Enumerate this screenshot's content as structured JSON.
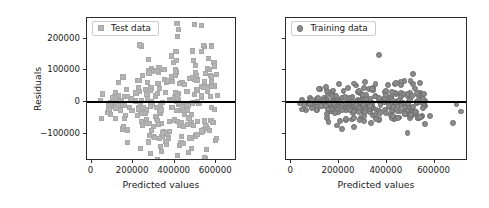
{
  "chart_data": [
    {
      "type": "scatter",
      "title": "",
      "xlabel": "Predicted values",
      "ylabel": "Residuals",
      "legend": "Test data",
      "legend_position": "upper-left",
      "marker": "square",
      "marker_color": "#b4b4b4",
      "grid": false,
      "xlim": [
        -22000,
        700000
      ],
      "ylim": [
        -185000,
        265000
      ],
      "xticks": [
        0,
        200000,
        400000,
        600000
      ],
      "xticklabels": [
        "0",
        "200000",
        "400000",
        "600000"
      ],
      "yticks": [
        -100000,
        0,
        100000,
        200000
      ],
      "yticklabels": [
        "−100000",
        "0",
        "100000",
        "200000"
      ],
      "reference_line": {
        "y": 0,
        "color": "#000000",
        "width": 2.2
      },
      "n_points": 230,
      "seed": 1337,
      "spread_model": {
        "base": 26000,
        "slope": 0.175,
        "x_min": 35000,
        "x_max": 600000
      },
      "points": [
        [
          406000,
          252000
        ],
        [
          571000,
          178000
        ],
        [
          404000,
          134000
        ],
        [
          588000,
          117000
        ],
        [
          312000,
          104000
        ],
        [
          288000,
          100000
        ],
        [
          402000,
          98000
        ],
        [
          481000,
          82000
        ],
        [
          272000,
          95000
        ],
        [
          398000,
          88000
        ],
        [
          345000,
          74000
        ],
        [
          535000,
          49000
        ],
        [
          420000,
          62000
        ],
        [
          360000,
          70000
        ],
        [
          524000,
          25000
        ],
        [
          455000,
          38000
        ],
        [
          566000,
          20000
        ],
        [
          408000,
          16000
        ],
        [
          538000,
          -56000
        ],
        [
          561000,
          -86000
        ],
        [
          487000,
          -70000
        ],
        [
          430000,
          -60000
        ],
        [
          372000,
          -88000
        ],
        [
          346000,
          -92000
        ],
        [
          268000,
          -122000
        ],
        [
          300000,
          -108000
        ],
        [
          322000,
          -112000
        ],
        [
          409000,
          -165000
        ],
        [
          338000,
          -94000
        ],
        [
          284000,
          -86000
        ]
      ],
      "xlabel_note": "Predicted values",
      "axis_color": "#2b2b2b"
    },
    {
      "type": "scatter",
      "title": "",
      "xlabel": "Predicted values",
      "ylabel": "",
      "legend": "Training data",
      "legend_position": "upper-left",
      "marker": "circle",
      "marker_color": "#8c8c8c",
      "grid": false,
      "xlim": [
        -22000,
        740000
      ],
      "ylim": [
        -185000,
        265000
      ],
      "xticks": [
        0,
        200000,
        400000,
        600000
      ],
      "xticklabels": [
        "0",
        "200000",
        "400000",
        "600000"
      ],
      "yticks": [
        -100000,
        0,
        100000,
        200000
      ],
      "yticklabels": [
        "",
        "",
        "",
        ""
      ],
      "reference_line": {
        "y": 0,
        "color": "#000000",
        "width": 2.2
      },
      "n_points": 250,
      "seed": 90210,
      "spread_model": {
        "base": 14000,
        "slope": 0.055,
        "x_min": 30000,
        "x_max": 560000
      },
      "points": [
        [
          363000,
          152000
        ],
        [
          258000,
          62000
        ],
        [
          305000,
          66000
        ],
        [
          196000,
          60000
        ],
        [
          142000,
          52000
        ],
        [
          232000,
          48000
        ],
        [
          333000,
          44000
        ],
        [
          418000,
          36000
        ],
        [
          466000,
          30000
        ],
        [
          112000,
          44000
        ],
        [
          172000,
          40000
        ],
        [
          278000,
          38000
        ],
        [
          392000,
          26000
        ],
        [
          503000,
          22000
        ],
        [
          548000,
          12000
        ],
        [
          688000,
          -4000
        ],
        [
          706000,
          -26000
        ],
        [
          672000,
          -62000
        ],
        [
          576000,
          -40000
        ],
        [
          534000,
          -44000
        ],
        [
          497000,
          -36000
        ],
        [
          444000,
          -46000
        ],
        [
          258000,
          -74000
        ],
        [
          207000,
          -82000
        ],
        [
          186000,
          -70000
        ],
        [
          152000,
          -58000
        ],
        [
          300000,
          -56000
        ],
        [
          352000,
          -50000
        ]
      ],
      "axis_color": "#2b2b2b"
    }
  ],
  "figure": {
    "width": 489,
    "height": 208,
    "background": "#ffffff",
    "panels": [
      {
        "name": "test-panel",
        "left": 86,
        "top": 17,
        "width": 150,
        "height": 143
      },
      {
        "name": "training-panel",
        "left": 285,
        "top": 17,
        "width": 182,
        "height": 143
      }
    ]
  }
}
